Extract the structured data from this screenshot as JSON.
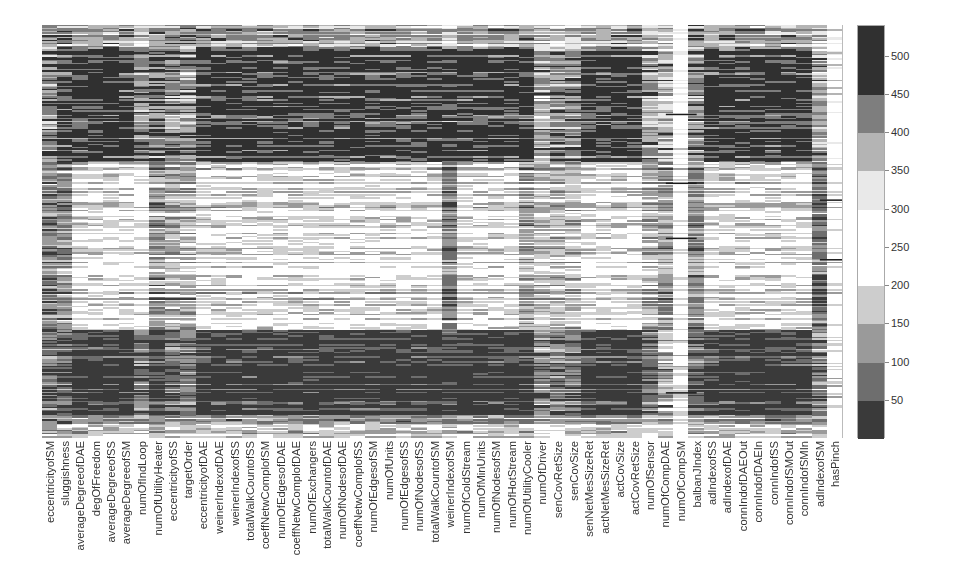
{
  "chart_data": {
    "type": "heatmap",
    "title": "",
    "xlabel": "",
    "ylabel": "",
    "colormap": "symmetric gray (dark at extremes, white at center)",
    "grid": false,
    "legend_position": "right colorbar",
    "columns": [
      "eccentricityofSM",
      "sluggishness",
      "averageDegreeofDAE",
      "degOfFreedom",
      "averageDegreeofSS",
      "averageDegreeofSM",
      "numOfIndLoop",
      "numOfUtilityHeater",
      "eccentricityofSS",
      "targetOrder",
      "eccentricityofDAE",
      "weinerIndexofDAE",
      "weinerIndexofSS",
      "totalWalkCountofSS",
      "coeffNetwComplofSM",
      "numOfEdgesofDAE",
      "coeffNetwComplofDAE",
      "numOfExchangers",
      "totalWalkCountofDAE",
      "numOfNodesofDAE",
      "coeffNetwComplofSS",
      "numOfEdgesofSM",
      "numOfUnits",
      "numOfEdgesofSS",
      "numOfNodesofSS",
      "totalWalkCountofSM",
      "weinerIndexofSM",
      "numOfColdStream",
      "numOfMinUnits",
      "numOfNodesofSM",
      "numOfHotStream",
      "numOfUtilityCooler",
      "numOfDriver",
      "senCovRetSize",
      "senCovSize",
      "senNetMesSizeRet",
      "actNetMesSizeRet",
      "actCovSize",
      "actCovRetSize",
      "numOfSensor",
      "numOfCompDAE",
      "numOfCompSM",
      "balbanJIndex",
      "adIndexofSS",
      "adIndexofDAE",
      "connIndofDAEOut",
      "connIndofDAEIn",
      "connIndofSS",
      "connIndofSMOut",
      "connIndofSMIn",
      "adIndexofSM",
      "hasPinch"
    ],
    "n_rows": 270,
    "value_range": [
      0,
      540
    ],
    "colorbar": {
      "ticks": [
        50,
        100,
        150,
        200,
        250,
        300,
        350,
        400,
        450,
        500
      ],
      "segments": [
        {
          "from": 0,
          "to": 50,
          "color": "#3a3a3a"
        },
        {
          "from": 50,
          "to": 100,
          "color": "#6e6e6e"
        },
        {
          "from": 100,
          "to": 150,
          "color": "#9a9a9a"
        },
        {
          "from": 150,
          "to": 200,
          "color": "#cdcdcd"
        },
        {
          "from": 200,
          "to": 300,
          "color": "#ffffff"
        },
        {
          "from": 300,
          "to": 350,
          "color": "#e9e9e9"
        },
        {
          "from": 350,
          "to": 400,
          "color": "#b4b4b4"
        },
        {
          "from": 400,
          "to": 450,
          "color": "#7e7e7e"
        },
        {
          "from": 450,
          "to": 540,
          "color": "#303030"
        }
      ]
    },
    "row_bands_description": [
      {
        "rows": [
          0,
          15
        ],
        "tone": "mixed light"
      },
      {
        "rows": [
          15,
          90
        ],
        "tone": "dark (high values) for most structural columns"
      },
      {
        "rows": [
          90,
          200
        ],
        "tone": "light / near-white (mid values)"
      },
      {
        "rows": [
          200,
          255
        ],
        "tone": "dark band (low values)"
      },
      {
        "rows": [
          255,
          270
        ],
        "tone": "mixed light"
      }
    ],
    "column_profiles": {
      "default": [
        0.45,
        0.85,
        0.15,
        0.85,
        0.4
      ],
      "eccentricityofSM": [
        0.5,
        0.6,
        0.55,
        0.6,
        0.5
      ],
      "sluggishness": [
        0.5,
        0.75,
        0.5,
        0.7,
        0.5
      ],
      "numOfIndLoop": [
        0.3,
        0.6,
        0.1,
        0.55,
        0.3
      ],
      "numOfUtilityHeater": [
        0.5,
        0.7,
        0.45,
        0.8,
        0.4
      ],
      "eccentricityofSS": [
        0.5,
        0.6,
        0.35,
        0.6,
        0.4
      ],
      "targetOrder": [
        0.5,
        0.55,
        0.35,
        0.55,
        0.4
      ],
      "weinerIndexofSM": [
        0.3,
        0.8,
        0.55,
        0.8,
        0.4
      ],
      "numOfUtilityCooler": [
        0.5,
        0.85,
        0.4,
        0.85,
        0.4
      ],
      "numOfDriver": [
        0.3,
        0.5,
        0.3,
        0.5,
        0.3
      ],
      "senCovRetSize": [
        0.3,
        0.6,
        0.3,
        0.55,
        0.3
      ],
      "senCovSize": [
        0.3,
        0.6,
        0.3,
        0.55,
        0.3
      ],
      "numOfSensor": [
        0.3,
        0.55,
        0.35,
        0.6,
        0.3
      ],
      "numOfCompDAE": [
        0.35,
        0.45,
        0.45,
        0.35,
        0.35
      ],
      "numOfCompSM": [
        0.02,
        0.02,
        0.02,
        0.02,
        0.02
      ],
      "balbanJIndex": [
        0.5,
        0.6,
        0.5,
        0.65,
        0.4
      ],
      "adIndexofSM": [
        0.3,
        0.5,
        0.6,
        0.5,
        0.4
      ],
      "hasPinch": [
        0.05,
        0.05,
        0.05,
        0.05,
        0.05
      ]
    },
    "step_lines": [
      {
        "col_from": 41,
        "col_to": 41,
        "row": 58,
        "note": "dark line across numOfCompSM"
      },
      {
        "col_from": 41,
        "col_to": 41,
        "row": 103
      },
      {
        "col_from": 41,
        "col_to": 41,
        "row": 139
      },
      {
        "col_from": 41,
        "col_to": 41,
        "row": 240
      },
      {
        "col_from": 51,
        "col_to": 51,
        "row": 114,
        "note": "dark tick line at hasPinch"
      },
      {
        "col_from": 51,
        "col_to": 51,
        "row": 153
      }
    ]
  }
}
